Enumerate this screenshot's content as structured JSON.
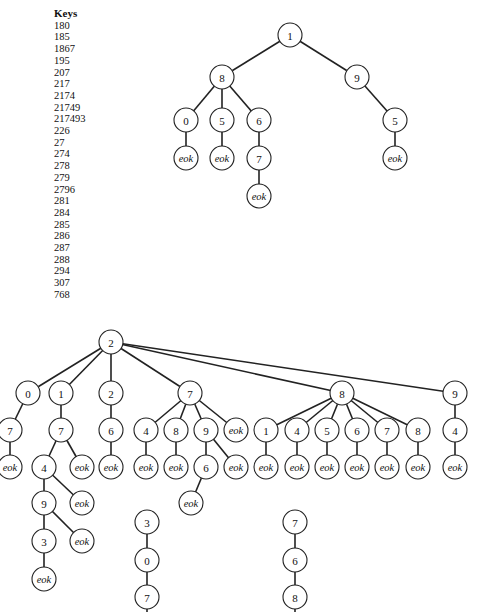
{
  "keys": {
    "header": "Keys",
    "items": [
      "180",
      "185",
      "1867",
      "195",
      "207",
      "217",
      "2174",
      "21749",
      "217493",
      "226",
      "27",
      "274",
      "278",
      "279",
      "2796",
      "281",
      "284",
      "285",
      "286",
      "287",
      "288",
      "294",
      "307",
      "768"
    ]
  },
  "trees": [
    {
      "name": "trie-1",
      "nodes": [
        {
          "id": "a",
          "label": "1",
          "x": 290,
          "y": 35
        },
        {
          "id": "b",
          "label": "8",
          "x": 222,
          "y": 77
        },
        {
          "id": "c",
          "label": "9",
          "x": 357,
          "y": 77
        },
        {
          "id": "d",
          "label": "0",
          "x": 186,
          "y": 120
        },
        {
          "id": "e",
          "label": "5",
          "x": 222,
          "y": 120
        },
        {
          "id": "f",
          "label": "6",
          "x": 259,
          "y": 120
        },
        {
          "id": "g",
          "label": "5",
          "x": 395,
          "y": 120
        },
        {
          "id": "h",
          "label": "eok",
          "x": 186,
          "y": 158
        },
        {
          "id": "i",
          "label": "eok",
          "x": 222,
          "y": 158
        },
        {
          "id": "j",
          "label": "7",
          "x": 259,
          "y": 158
        },
        {
          "id": "k",
          "label": "eok",
          "x": 395,
          "y": 158
        },
        {
          "id": "l",
          "label": "eok",
          "x": 259,
          "y": 196
        }
      ],
      "edges": [
        [
          "a",
          "b"
        ],
        [
          "a",
          "c"
        ],
        [
          "b",
          "d"
        ],
        [
          "b",
          "e"
        ],
        [
          "b",
          "f"
        ],
        [
          "c",
          "g"
        ],
        [
          "d",
          "h"
        ],
        [
          "e",
          "i"
        ],
        [
          "f",
          "j"
        ],
        [
          "g",
          "k"
        ],
        [
          "j",
          "l"
        ]
      ]
    },
    {
      "name": "trie-2",
      "nodes": [
        {
          "id": "r",
          "label": "2",
          "x": 111,
          "y": 342
        },
        {
          "id": "n0",
          "label": "0",
          "x": 28,
          "y": 393
        },
        {
          "id": "n1",
          "label": "1",
          "x": 61,
          "y": 393
        },
        {
          "id": "n2",
          "label": "2",
          "x": 111,
          "y": 393
        },
        {
          "id": "n7",
          "label": "7",
          "x": 190,
          "y": 393
        },
        {
          "id": "n8",
          "label": "8",
          "x": 342,
          "y": 393
        },
        {
          "id": "n9",
          "label": "9",
          "x": 455,
          "y": 393
        },
        {
          "id": "n07",
          "label": "7",
          "x": 10,
          "y": 430
        },
        {
          "id": "n17",
          "label": "7",
          "x": 61,
          "y": 430
        },
        {
          "id": "n26",
          "label": "6",
          "x": 111,
          "y": 430
        },
        {
          "id": "n74",
          "label": "4",
          "x": 146,
          "y": 430
        },
        {
          "id": "n78",
          "label": "8",
          "x": 176,
          "y": 430
        },
        {
          "id": "n79",
          "label": "9",
          "x": 206,
          "y": 430
        },
        {
          "id": "n7e",
          "label": "eok",
          "x": 236,
          "y": 430
        },
        {
          "id": "n81",
          "label": "1",
          "x": 266,
          "y": 430
        },
        {
          "id": "n84",
          "label": "4",
          "x": 297,
          "y": 430
        },
        {
          "id": "n85",
          "label": "5",
          "x": 327,
          "y": 430
        },
        {
          "id": "n86",
          "label": "6",
          "x": 357,
          "y": 430
        },
        {
          "id": "n87",
          "label": "7",
          "x": 387,
          "y": 430
        },
        {
          "id": "n88",
          "label": "8",
          "x": 418,
          "y": 430
        },
        {
          "id": "n94",
          "label": "4",
          "x": 455,
          "y": 430
        },
        {
          "id": "e07",
          "label": "eok",
          "x": 10,
          "y": 467
        },
        {
          "id": "n174",
          "label": "4",
          "x": 44,
          "y": 467
        },
        {
          "id": "e17",
          "label": "eok",
          "x": 82,
          "y": 467
        },
        {
          "id": "e26",
          "label": "eok",
          "x": 111,
          "y": 467
        },
        {
          "id": "e74",
          "label": "eok",
          "x": 146,
          "y": 467
        },
        {
          "id": "e78",
          "label": "eok",
          "x": 176,
          "y": 467
        },
        {
          "id": "n796",
          "label": "6",
          "x": 206,
          "y": 467
        },
        {
          "id": "e79",
          "label": "eok",
          "x": 236,
          "y": 467
        },
        {
          "id": "e81",
          "label": "eok",
          "x": 266,
          "y": 467
        },
        {
          "id": "e84",
          "label": "eok",
          "x": 297,
          "y": 467
        },
        {
          "id": "e85",
          "label": "eok",
          "x": 327,
          "y": 467
        },
        {
          "id": "e86",
          "label": "eok",
          "x": 357,
          "y": 467
        },
        {
          "id": "e87",
          "label": "eok",
          "x": 387,
          "y": 467
        },
        {
          "id": "e88",
          "label": "eok",
          "x": 418,
          "y": 467
        },
        {
          "id": "e94",
          "label": "eok",
          "x": 455,
          "y": 467
        },
        {
          "id": "n1749",
          "label": "9",
          "x": 44,
          "y": 503
        },
        {
          "id": "e174",
          "label": "eok",
          "x": 82,
          "y": 503
        },
        {
          "id": "e796",
          "label": "eok",
          "x": 191,
          "y": 503
        },
        {
          "id": "n17493",
          "label": "3",
          "x": 44,
          "y": 541
        },
        {
          "id": "e1749",
          "label": "eok",
          "x": 82,
          "y": 541
        },
        {
          "id": "e17493",
          "label": "eok",
          "x": 44,
          "y": 579
        },
        {
          "id": "s3",
          "label": "3",
          "x": 147,
          "y": 522
        },
        {
          "id": "s0",
          "label": "0",
          "x": 147,
          "y": 560
        },
        {
          "id": "s7",
          "label": "7",
          "x": 147,
          "y": 597
        },
        {
          "id": "t7",
          "label": "7",
          "x": 295,
          "y": 522
        },
        {
          "id": "t6",
          "label": "6",
          "x": 295,
          "y": 560
        },
        {
          "id": "t8",
          "label": "8",
          "x": 295,
          "y": 597
        }
      ],
      "edges": [
        [
          "r",
          "n0"
        ],
        [
          "r",
          "n1"
        ],
        [
          "r",
          "n2"
        ],
        [
          "r",
          "n7"
        ],
        [
          "r",
          "n8"
        ],
        [
          "r",
          "n9"
        ],
        [
          "n0",
          "n07"
        ],
        [
          "n1",
          "n17"
        ],
        [
          "n2",
          "n26"
        ],
        [
          "n7",
          "n74"
        ],
        [
          "n7",
          "n78"
        ],
        [
          "n7",
          "n79"
        ],
        [
          "n7",
          "n7e"
        ],
        [
          "n8",
          "n81"
        ],
        [
          "n8",
          "n84"
        ],
        [
          "n8",
          "n85"
        ],
        [
          "n8",
          "n86"
        ],
        [
          "n8",
          "n87"
        ],
        [
          "n8",
          "n88"
        ],
        [
          "n9",
          "n94"
        ],
        [
          "n07",
          "e07"
        ],
        [
          "n17",
          "n174"
        ],
        [
          "n17",
          "e17"
        ],
        [
          "n26",
          "e26"
        ],
        [
          "n74",
          "e74"
        ],
        [
          "n78",
          "e78"
        ],
        [
          "n79",
          "n796"
        ],
        [
          "n79",
          "e79"
        ],
        [
          "n81",
          "e81"
        ],
        [
          "n84",
          "e84"
        ],
        [
          "n85",
          "e85"
        ],
        [
          "n86",
          "e86"
        ],
        [
          "n87",
          "e87"
        ],
        [
          "n88",
          "e88"
        ],
        [
          "n94",
          "e94"
        ],
        [
          "n174",
          "n1749"
        ],
        [
          "n174",
          "e174"
        ],
        [
          "n796",
          "e796"
        ],
        [
          "n1749",
          "n17493"
        ],
        [
          "n1749",
          "e1749"
        ],
        [
          "n17493",
          "e17493"
        ],
        [
          "s3",
          "s0"
        ],
        [
          "s0",
          "s7"
        ],
        [
          "s7",
          "s7b"
        ],
        [
          "t7",
          "t6"
        ],
        [
          "t6",
          "t8"
        ],
        [
          "t8",
          "t8b"
        ]
      ]
    }
  ]
}
